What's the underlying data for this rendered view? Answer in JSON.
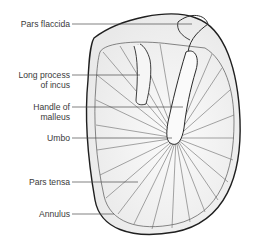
{
  "diagram": {
    "labels": [
      {
        "id": "pars-flaccida",
        "text": "Pars flaccida",
        "line_y": 24
      },
      {
        "id": "long-process-incus",
        "text": "Long process\nof incus",
        "line1": "Long process",
        "line2": "of incus",
        "line_y": 75
      },
      {
        "id": "handle-malleus",
        "text": "Handle of\nmalleus",
        "line1": "Handle of",
        "line2": "malleus",
        "line_y": 107
      },
      {
        "id": "umbo",
        "text": "Umbo",
        "line_y": 138
      },
      {
        "id": "pars-tensa",
        "text": "Pars tensa",
        "line_y": 182
      },
      {
        "id": "annulus",
        "text": "Annulus",
        "line_y": 214
      }
    ],
    "colors": {
      "outline": "#1f1f1f",
      "fibers": "#6a6a6a",
      "fill": "#f3f3f3",
      "label_text": "#3a3a3a",
      "leader": "#4a4a4a"
    }
  }
}
